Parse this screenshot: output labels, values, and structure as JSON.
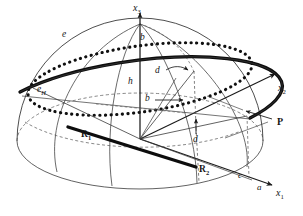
{
  "figure": {
    "kind": "3d-geometry-diagram",
    "background_color": "#ffffff",
    "ink_color": "#151515",
    "thin_color": "#3a3a3a",
    "dash_color": "#555555"
  },
  "axes": [
    {
      "name": "x3",
      "base": "x",
      "sub": "3",
      "x": 139,
      "y": 4
    },
    {
      "name": "x2",
      "base": "x",
      "sub": "2",
      "x": 281,
      "y": 88
    },
    {
      "name": "x1",
      "base": "x",
      "sub": "1",
      "x": 279,
      "y": 193
    }
  ],
  "labels": [
    {
      "name": "e",
      "text": "e",
      "style": "italic",
      "x": 64,
      "y": 35
    },
    {
      "name": "e-h",
      "base": "e",
      "sub": "H",
      "style": "italic-sub",
      "x": 39,
      "y": 90
    },
    {
      "name": "b-top",
      "text": "b",
      "style": "italic",
      "x": 142,
      "y": 38
    },
    {
      "name": "h",
      "text": "h",
      "style": "italic",
      "x": 130,
      "y": 82
    },
    {
      "name": "d-upper",
      "text": "d",
      "style": "italic",
      "x": 157,
      "y": 72
    },
    {
      "name": "b-mid",
      "text": "b",
      "style": "italic",
      "x": 148,
      "y": 98
    },
    {
      "name": "d-lower",
      "text": "d",
      "style": "italic",
      "x": 195,
      "y": 138
    },
    {
      "name": "r1",
      "base": "R",
      "sub": "1",
      "style": "bold-sub",
      "x": 83,
      "y": 135
    },
    {
      "name": "r2",
      "base": "R",
      "sub": "2",
      "style": "bold-sub",
      "x": 201,
      "y": 169
    },
    {
      "name": "p",
      "text": "P",
      "style": "bold",
      "x": 278,
      "y": 121
    },
    {
      "name": "c",
      "text": "c",
      "style": "italic",
      "x": 239,
      "y": 175
    },
    {
      "name": "a",
      "text": "a",
      "style": "italic",
      "x": 258,
      "y": 186
    }
  ]
}
